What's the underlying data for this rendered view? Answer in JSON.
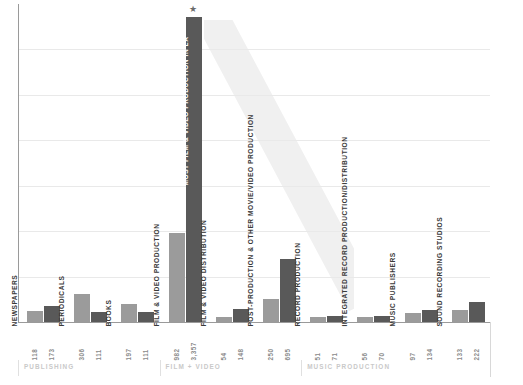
{
  "chart_data": {
    "type": "bar",
    "title": "",
    "subtitle": "",
    "xlabel": "",
    "ylabel": "",
    "ylim": [
      0,
      3500
    ],
    "grid": true,
    "legend_position": "none",
    "orientation": "vertical",
    "series": [
      {
        "name": "series-a",
        "color": "#9b9b9b"
      },
      {
        "name": "series-b",
        "color": "#595959"
      }
    ],
    "gridlines": [
      500,
      1000,
      1500,
      2000,
      2500,
      3000
    ],
    "annotations": [
      {
        "text": "MOST FILM & VIDEO PRODUCTION IN LA",
        "marker": "★",
        "category": "FILM & VIDEO PRODUCTION"
      }
    ],
    "groups": [
      {
        "label": "PUBLISHING",
        "categories": [
          "NEWSPAPERS",
          "PERIODICALS",
          "BOOKS"
        ]
      },
      {
        "label": "FILM + VIDEO",
        "categories": [
          "FILM & VIDEO PRODUCTION",
          "FILM & VIDEO DISTRIBUTION",
          "POST-PRODUCTION & OTHER MOVIE/VIDEO PRODUCTION"
        ]
      },
      {
        "label": "MUSIC PRODUCTION",
        "categories": [
          "RECORD PRODUCTION",
          "INTEGRATED RECORD PRODUCTION/DISTRIBUTION",
          "MUSIC PUBLISHERS",
          "SOUND RECORDING STUDIOS"
        ]
      }
    ],
    "categories": [
      "NEWSPAPERS",
      "PERIODICALS",
      "BOOKS",
      "FILM & VIDEO PRODUCTION",
      "FILM & VIDEO DISTRIBUTION",
      "POST-PRODUCTION & OTHER MOVIE/VIDEO PRODUCTION",
      "RECORD PRODUCTION",
      "INTEGRATED RECORD PRODUCTION/DISTRIBUTION",
      "MUSIC PUBLISHERS",
      "SOUND RECORDING STUDIOS"
    ],
    "points": [
      {
        "category": "NEWSPAPERS",
        "a": 118,
        "b": 173,
        "a_label": "118",
        "b_label": "173"
      },
      {
        "category": "PERIODICALS",
        "a": 306,
        "b": 111,
        "a_label": "306",
        "b_label": "111"
      },
      {
        "category": "BOOKS",
        "a": 197,
        "b": 111,
        "a_label": "197",
        "b_label": "111"
      },
      {
        "category": "FILM & VIDEO PRODUCTION",
        "a": 982,
        "b": 3357,
        "a_label": "982",
        "b_label": "3,357"
      },
      {
        "category": "FILM & VIDEO DISTRIBUTION",
        "a": 54,
        "b": 148,
        "a_label": "54",
        "b_label": "148"
      },
      {
        "category": "POST-PRODUCTION & OTHER MOVIE/VIDEO PRODUCTION",
        "a": 250,
        "b": 695,
        "a_label": "250",
        "b_label": "695"
      },
      {
        "category": "RECORD PRODUCTION",
        "a": 51,
        "b": 71,
        "a_label": "51",
        "b_label": "71"
      },
      {
        "category": "INTEGRATED RECORD PRODUCTION/DISTRIBUTION",
        "a": 56,
        "b": 70,
        "a_label": "56",
        "b_label": "70"
      },
      {
        "category": "MUSIC PUBLISHERS",
        "a": 97,
        "b": 134,
        "a_label": "97",
        "b_label": "134"
      },
      {
        "category": "SOUND RECORDING STUDIOS",
        "a": 133,
        "b": 222,
        "a_label": "133",
        "b_label": "222"
      }
    ],
    "colors": {
      "series_a": "#9b9b9b",
      "series_b": "#595959",
      "gridline": "#e9e9e9",
      "axis": "#9a9a9a",
      "value_label": "#8a8a8a",
      "category_label": "#3a3a3a",
      "category_label_on_bar": "#ffffff",
      "group_label": "#c9c9c9",
      "watermark": "#f0f0f0",
      "background": "#ffffff"
    }
  }
}
